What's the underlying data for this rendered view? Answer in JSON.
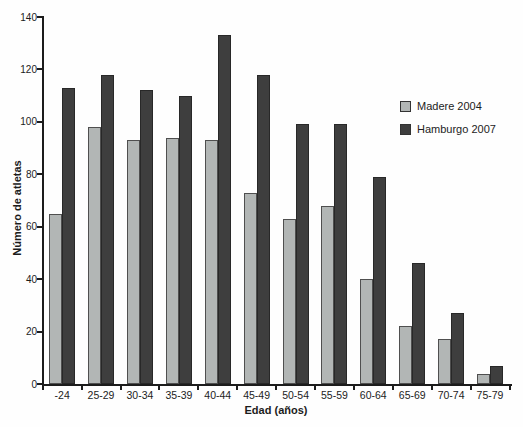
{
  "chart_data": {
    "type": "bar",
    "title": "",
    "xlabel": "Edad (años)",
    "ylabel": "Número de atletas",
    "categories": [
      "-24",
      "25-29",
      "30-34",
      "35-39",
      "40-44",
      "45-49",
      "50-54",
      "55-59",
      "60-64",
      "65-69",
      "70-74",
      "75-79"
    ],
    "series": [
      {
        "name": "Madere 2004",
        "color": "#b2b6b5",
        "border_color": "#4f4f4f",
        "values": [
          65,
          98,
          93,
          94,
          93,
          73,
          63,
          68,
          40,
          22,
          17,
          4
        ]
      },
      {
        "name": "Hamburgo 2007",
        "color": "#3e3e3e",
        "border_color": "#282828",
        "values": [
          113,
          118,
          112,
          110,
          133,
          118,
          99,
          99,
          79,
          46,
          27,
          7
        ]
      }
    ],
    "ylim": [
      0,
      140
    ],
    "yticks": [
      0,
      20,
      40,
      60,
      80,
      100,
      120,
      140
    ],
    "grid": false,
    "legend_position": "upper-right",
    "axis_color": "#1c1c1c"
  }
}
